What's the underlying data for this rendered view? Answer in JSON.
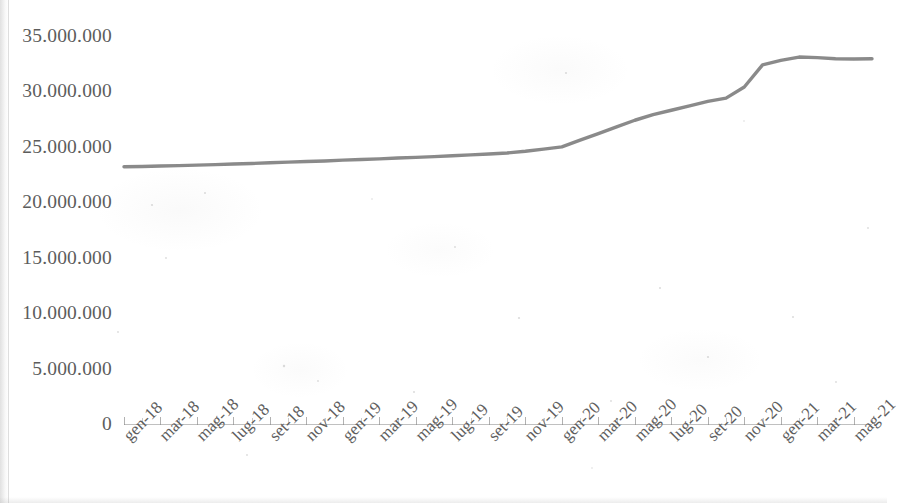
{
  "chart_data": {
    "type": "line",
    "title": "",
    "subtitle": "",
    "xlabel": "",
    "ylabel": "",
    "grid": false,
    "legend": false,
    "legend_position": "none",
    "line_color": "#808080",
    "background_color": "#ffffff",
    "axis_color": "#8c8c8c",
    "tick_label_color": "#5c5c5c",
    "number_format": "dot-thousands-separator",
    "ylim": [
      0,
      35000000
    ],
    "ytick_labels": [
      "35.000.000",
      "30.000.000",
      "25.000.000",
      "20.000.000",
      "15.000.000",
      "10.000.000",
      "5.000.000",
      "0"
    ],
    "ytick_values": [
      35000000,
      30000000,
      25000000,
      20000000,
      15000000,
      10000000,
      5000000,
      0
    ],
    "xtick_labels": [
      "gen-18",
      "mar-18",
      "mag-18",
      "lug-18",
      "set-18",
      "nov-18",
      "gen-19",
      "mar-19",
      "mag-19",
      "lug-19",
      "set-19",
      "nov-19",
      "gen-20",
      "mar-20",
      "mag-20",
      "lug-20",
      "set-20",
      "nov-20",
      "gen-21",
      "mar-21",
      "mag-21"
    ],
    "x": [
      "gen-18",
      "feb-18",
      "mar-18",
      "apr-18",
      "mag-18",
      "giu-18",
      "lug-18",
      "ago-18",
      "set-18",
      "ott-18",
      "nov-18",
      "dic-18",
      "gen-19",
      "feb-19",
      "mar-19",
      "apr-19",
      "mag-19",
      "giu-19",
      "lug-19",
      "ago-19",
      "set-19",
      "ott-19",
      "nov-19",
      "dic-19",
      "gen-20",
      "feb-20",
      "mar-20",
      "apr-20",
      "mag-20",
      "giu-20",
      "lug-20",
      "ago-20",
      "set-20",
      "ott-20",
      "nov-20",
      "dic-20",
      "gen-21",
      "feb-21",
      "mar-21",
      "apr-21",
      "mag-21",
      "giu-21"
    ],
    "values": [
      23200000,
      23230000,
      23270000,
      23310000,
      23350000,
      23400000,
      23450000,
      23500000,
      23560000,
      23620000,
      23680000,
      23730000,
      23800000,
      23860000,
      23920000,
      23990000,
      24050000,
      24120000,
      24200000,
      24280000,
      24360000,
      24450000,
      24600000,
      24800000,
      25000000,
      25600000,
      26200000,
      26800000,
      27400000,
      27900000,
      28300000,
      28700000,
      29100000,
      29400000,
      30400000,
      32400000,
      32800000,
      33100000,
      33050000,
      32950000,
      32920000,
      32950000
    ]
  }
}
